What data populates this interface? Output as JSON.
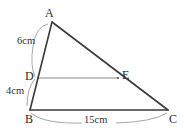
{
  "figure": {
    "type": "geometry-diagram",
    "background_color": "#ffffff",
    "stroke_color_main": "#3a3a3a",
    "stroke_color_thin": "#888888",
    "vertices": [
      {
        "id": "A",
        "label": "A",
        "x": 52,
        "y": 22
      },
      {
        "id": "B",
        "label": "B",
        "x": 30,
        "y": 110
      },
      {
        "id": "C",
        "label": "C",
        "x": 168,
        "y": 110
      },
      {
        "id": "D",
        "label": "D",
        "x": 38,
        "y": 78
      },
      {
        "id": "E",
        "label": "E",
        "x": 118,
        "y": 78
      }
    ],
    "segments": [
      {
        "id": "AB",
        "from": "A",
        "to": "B",
        "style": "solid-dark"
      },
      {
        "id": "AC",
        "from": "A",
        "to": "C",
        "style": "solid-dark"
      },
      {
        "id": "BC",
        "from": "B",
        "to": "C",
        "style": "solid-dark"
      },
      {
        "id": "DE",
        "from": "D",
        "to": "E",
        "style": "solid-thin"
      }
    ],
    "measurements": [
      {
        "id": "ad",
        "segment": "AD",
        "label": "6cm",
        "value": 6,
        "unit": "cm"
      },
      {
        "id": "db",
        "segment": "DB",
        "label": "4cm",
        "value": 4,
        "unit": "cm"
      },
      {
        "id": "bc",
        "segment": "BC",
        "label": "15cm",
        "value": 15,
        "unit": "cm"
      }
    ]
  }
}
